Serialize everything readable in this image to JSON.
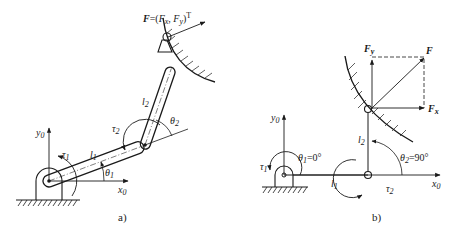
{
  "figure": {
    "top_partial_text": "",
    "panel_a": {
      "caption": "a)",
      "force_label": {
        "F": "F",
        "eq": "=(",
        "Fx": "F",
        "x": "x",
        "comma": ", ",
        "Fy": "F",
        "y": "y",
        "close": ")",
        "T": "T"
      },
      "axis_y": {
        "base": "y",
        "sub": "0"
      },
      "axis_x": {
        "base": "x",
        "sub": "0"
      },
      "tau1": {
        "base": "τ",
        "sub": "1"
      },
      "tau2": {
        "base": "τ",
        "sub": "2"
      },
      "l1": {
        "base": "l",
        "sub": "1"
      },
      "l2": {
        "base": "l",
        "sub": "2"
      },
      "theta1": {
        "base": "θ",
        "sub": "1"
      },
      "theta2": {
        "base": "θ",
        "sub": "2"
      }
    },
    "panel_b": {
      "caption": "b)",
      "F": "F",
      "Fx": {
        "base": "F",
        "sub": "x"
      },
      "Fy": {
        "base": "F",
        "sub": "y"
      },
      "axis_y": {
        "base": "y",
        "sub": "0"
      },
      "axis_x": {
        "base": "x",
        "sub": "0"
      },
      "tau1": {
        "base": "τ",
        "sub": "1"
      },
      "tau2": {
        "base": "τ",
        "sub": "2"
      },
      "l1": {
        "base": "l",
        "sub": "1"
      },
      "l2": {
        "base": "l",
        "sub": "2"
      },
      "theta1": {
        "base": "θ",
        "sub": "1",
        "value": "=0°"
      },
      "theta2": {
        "base": "θ",
        "sub": "2",
        "value": "=90°"
      }
    }
  }
}
